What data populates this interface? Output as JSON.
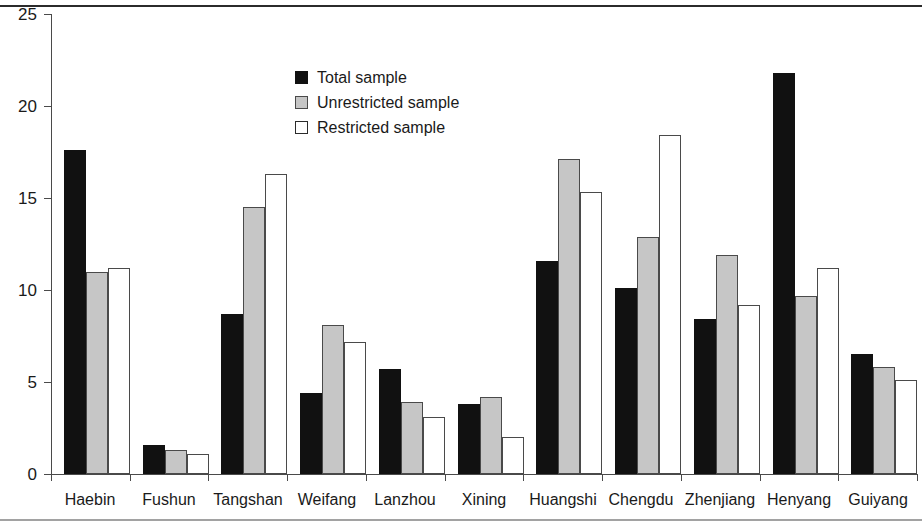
{
  "chart_data": {
    "type": "bar",
    "title": "",
    "xlabel": "",
    "ylabel": "",
    "ylim": [
      0,
      25
    ],
    "yticks": [
      0,
      5,
      10,
      15,
      20,
      25
    ],
    "ytick_labels": [
      "0",
      "5",
      "10",
      "15",
      "20",
      "25"
    ],
    "grid": false,
    "legend_position": "upper-center-left",
    "categories": [
      "Haebin",
      "Fushun",
      "Tangshan",
      "Weifang",
      "Lanzhou",
      "Xining",
      "Huangshi",
      "Chengdu",
      "Zhenjiang",
      "Henyang",
      "Guiyang"
    ],
    "series": [
      {
        "name": "Total sample",
        "color": "#111111",
        "values": [
          17.6,
          1.6,
          8.7,
          4.4,
          5.7,
          3.8,
          11.6,
          10.1,
          8.4,
          21.8,
          6.5
        ]
      },
      {
        "name": "Unrestricted sample",
        "color": "#c6c6c6",
        "values": [
          11.0,
          1.3,
          14.5,
          8.1,
          3.9,
          4.2,
          17.1,
          12.9,
          11.9,
          9.7,
          5.8
        ]
      },
      {
        "name": "Restricted sample",
        "color": "#ffffff",
        "values": [
          11.2,
          1.1,
          16.3,
          7.2,
          3.1,
          2.0,
          15.3,
          18.4,
          9.2,
          11.2,
          5.1
        ]
      }
    ]
  },
  "legend": {
    "items": [
      {
        "label": "Total sample",
        "swatch": "total"
      },
      {
        "label": "Unrestricted sample",
        "swatch": "unrestricted"
      },
      {
        "label": "Restricted sample",
        "swatch": "restricted"
      }
    ]
  }
}
